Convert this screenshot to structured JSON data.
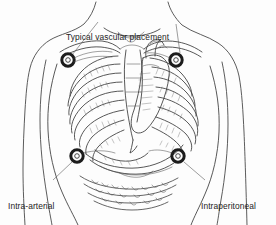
{
  "illustration": {
    "title": "Anatomical torso diagram of implanted port placements",
    "view": "anterior",
    "background_color": "#fdfdfd",
    "ink_color": "#3a3a3a",
    "text_color": "#242424",
    "marker_color": "#1c1c1c"
  },
  "labels": {
    "vascular": {
      "text": "Typical vascular placement",
      "lines": [
        "Typical vascular placement"
      ]
    },
    "arterial": {
      "text": "Intra-arterial placement",
      "lines": [
        "Intra-arterial",
        "placement"
      ]
    },
    "peritoneal": {
      "text": "Intraperitoneal placement",
      "lines": [
        "Intraperitoneal",
        "placement"
      ]
    }
  },
  "markers": [
    {
      "name": "port-upper-left",
      "cx": 68,
      "cy": 60,
      "r": 6.2,
      "label": "vascular"
    },
    {
      "name": "port-upper-right",
      "cx": 176,
      "cy": 60,
      "r": 6.2,
      "label": "vascular"
    },
    {
      "name": "port-lower-left",
      "cx": 77,
      "cy": 156,
      "r": 6.2,
      "label": "arterial"
    },
    {
      "name": "port-lower-right",
      "cx": 178,
      "cy": 156,
      "r": 6.2,
      "label": "peritoneal"
    }
  ],
  "anatomy_parts": [
    "body-outline",
    "neck",
    "shoulders",
    "arms",
    "clavicle",
    "ribcage-left",
    "ribcage-right",
    "sternum",
    "costal-cartilage",
    "heart",
    "diaphragm",
    "liver",
    "intestines"
  ]
}
